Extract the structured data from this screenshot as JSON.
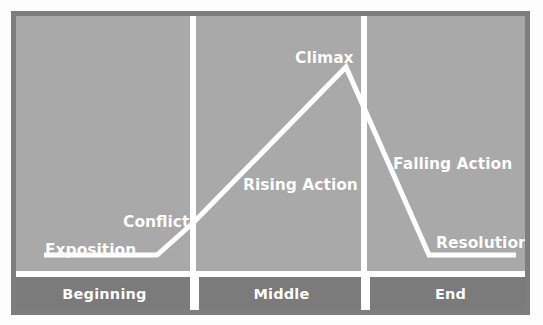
{
  "diagram": {
    "colors": {
      "frame": "#7e7e7e",
      "canvas_background": "#a9a9a9",
      "stage_band": "#7b7b7b",
      "line": "#ffffff",
      "label_text": "#ffffff"
    },
    "arc_labels": [
      {
        "key": "exposition",
        "text": "Exposition"
      },
      {
        "key": "conflict",
        "text": "Conflict"
      },
      {
        "key": "rising_action",
        "text": "Rising Action"
      },
      {
        "key": "climax",
        "text": "Climax"
      },
      {
        "key": "falling_action",
        "text": "Falling Action"
      },
      {
        "key": "resolution",
        "text": "Resolution"
      }
    ],
    "stages": [
      {
        "key": "beginning",
        "label": "Beginning"
      },
      {
        "key": "middle",
        "label": "Middle"
      },
      {
        "key": "end",
        "label": "End"
      }
    ]
  },
  "chart_data": {
    "type": "line",
    "xlabel": "",
    "ylabel": "",
    "grid": false,
    "legend": "none",
    "xlim": [
      0,
      509
    ],
    "ylim": [
      0,
      294
    ],
    "series": [
      {
        "name": "Story Arc",
        "points": [
          {
            "x": 28,
            "y": 239,
            "label": "Exposition"
          },
          {
            "x": 141,
            "y": 239,
            "label": ""
          },
          {
            "x": 178,
            "y": 206,
            "label": "Conflict"
          },
          {
            "x": 330,
            "y": 51,
            "label": "Climax"
          },
          {
            "x": 413,
            "y": 239,
            "label": ""
          },
          {
            "x": 500,
            "y": 239,
            "label": "Resolution"
          }
        ]
      }
    ],
    "annotations": [
      {
        "text": "Exposition",
        "x": 29,
        "y": 225
      },
      {
        "text": "Conflict",
        "x": 107,
        "y": 197
      },
      {
        "text": "Rising Action",
        "x": 227,
        "y": 160
      },
      {
        "text": "Climax",
        "x": 279,
        "y": 33
      },
      {
        "text": "Falling Action",
        "x": 377,
        "y": 139
      },
      {
        "text": "Resolution",
        "x": 420,
        "y": 218
      }
    ],
    "dividers": [
      {
        "label": "Beginning | Middle",
        "x": 177
      },
      {
        "label": "Middle | End",
        "x": 348
      }
    ],
    "categories": [
      "Beginning",
      "Middle",
      "End"
    ]
  }
}
